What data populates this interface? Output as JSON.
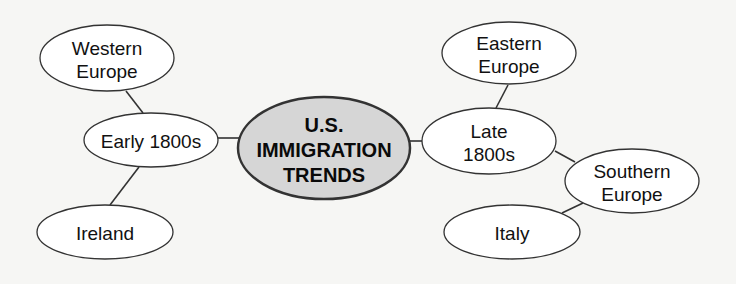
{
  "diagram": {
    "type": "concept-web",
    "colors": {
      "background": "#f6f6f4",
      "node_fill": "#ffffff",
      "center_fill": "#d6d6d6",
      "stroke": "#333333",
      "text": "#111111"
    },
    "center": {
      "id": "center",
      "lines": [
        "U.S.",
        "IMMIGRATION",
        "TRENDS"
      ],
      "cx": 324,
      "cy": 148,
      "rx": 86,
      "ry": 51
    },
    "nodes": [
      {
        "id": "western-europe",
        "lines": [
          "Western",
          "Europe"
        ],
        "cx": 107,
        "cy": 58,
        "rx": 67,
        "ry": 33
      },
      {
        "id": "early-1800s",
        "lines": [
          "Early 1800s"
        ],
        "cx": 151,
        "cy": 140,
        "rx": 67,
        "ry": 27
      },
      {
        "id": "ireland",
        "lines": [
          "Ireland"
        ],
        "cx": 105,
        "cy": 232,
        "rx": 68,
        "ry": 27
      },
      {
        "id": "eastern-europe",
        "lines": [
          "Eastern",
          "Europe"
        ],
        "cx": 509,
        "cy": 53,
        "rx": 67,
        "ry": 31
      },
      {
        "id": "late-1800s",
        "lines": [
          "Late",
          "1800s"
        ],
        "cx": 489,
        "cy": 141,
        "rx": 67,
        "ry": 33
      },
      {
        "id": "southern-europe",
        "lines": [
          "Southern",
          "Europe"
        ],
        "cx": 632,
        "cy": 181,
        "rx": 67,
        "ry": 32
      },
      {
        "id": "italy",
        "lines": [
          "Italy"
        ],
        "cx": 512,
        "cy": 232,
        "rx": 68,
        "ry": 27
      }
    ],
    "edges": [
      {
        "from": "western-europe",
        "to": "early-1800s",
        "x1": 126,
        "y1": 91,
        "x2": 143,
        "y2": 113
      },
      {
        "from": "early-1800s",
        "to": "ireland",
        "x1": 139,
        "y1": 167,
        "x2": 110,
        "y2": 205
      },
      {
        "from": "early-1800s",
        "to": "center",
        "x1": 218,
        "y1": 138,
        "x2": 239,
        "y2": 138
      },
      {
        "from": "center",
        "to": "late-1800s",
        "x1": 409,
        "y1": 141,
        "x2": 422,
        "y2": 141
      },
      {
        "from": "eastern-europe",
        "to": "late-1800s",
        "x1": 508,
        "y1": 85,
        "x2": 496,
        "y2": 108
      },
      {
        "from": "late-1800s",
        "to": "southern-europe",
        "x1": 555,
        "y1": 151,
        "x2": 575,
        "y2": 162
      },
      {
        "from": "southern-europe",
        "to": "italy",
        "x1": 583,
        "y1": 203,
        "x2": 562,
        "y2": 213
      }
    ]
  }
}
